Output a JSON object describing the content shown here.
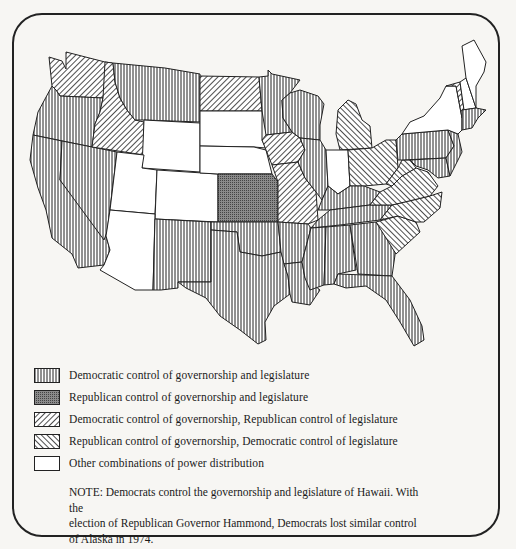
{
  "map": {
    "title": "",
    "region": "Continental United States, state-level partisan control (1974)",
    "patterns": {
      "dem_both": {
        "style": "vertical-lines",
        "color": "#222222"
      },
      "rep_both": {
        "style": "stipple",
        "color": "#555555"
      },
      "dem_gov_rep_leg": {
        "style": "diagonal-back",
        "color": "#222222"
      },
      "rep_gov_dem_leg": {
        "style": "diagonal-forward",
        "color": "#222222"
      },
      "other": {
        "style": "blank",
        "color": "#ffffff"
      }
    },
    "states": {
      "dem_both": [
        "Oregon",
        "California",
        "Nevada",
        "Montana",
        "Minnesota",
        "Wisconsin",
        "New Mexico",
        "Oklahoma",
        "Texas",
        "Arkansas",
        "Louisiana",
        "Mississippi",
        "Alabama",
        "Georgia",
        "Florida",
        "Tennessee",
        "Kentucky",
        "Illinois",
        "Pennsylvania",
        "Massachusetts",
        "Rhode Island",
        "Connecticut",
        "New Jersey",
        "Maryland",
        "Delaware"
      ],
      "rep_both": [
        "Kansas"
      ],
      "dem_gov_rep_leg": [
        "Washington",
        "Idaho",
        "North Dakota",
        "Iowa",
        "Missouri",
        "Vermont"
      ],
      "rep_gov_dem_leg": [
        "Michigan",
        "Ohio",
        "West Virginia",
        "Virginia",
        "North Carolina",
        "South Carolina"
      ],
      "other": [
        "Wyoming",
        "Utah",
        "Colorado",
        "Arizona",
        "South Dakota",
        "Nebraska",
        "Indiana",
        "New York",
        "Maine",
        "New Hampshire"
      ]
    }
  },
  "legend": {
    "items": [
      {
        "key": "dem_both",
        "label": "Democratic control of governorship and legislature"
      },
      {
        "key": "rep_both",
        "label": "Republican control of governorship and legislature"
      },
      {
        "key": "dem_gov_rep_leg",
        "label": "Democratic control of governorship, Republican control of legislature"
      },
      {
        "key": "rep_gov_dem_leg",
        "label": "Republican control of governorship, Democratic control of legislature"
      },
      {
        "key": "other",
        "label": "Other combinations of power distribution"
      }
    ]
  },
  "note": {
    "line1": "NOTE: Democrats control the governorship and legislature of Hawaii. With the",
    "line2": "election of Republican Governor Hammond, Democrats lost similar control",
    "line3": "of Alaska in 1974."
  }
}
